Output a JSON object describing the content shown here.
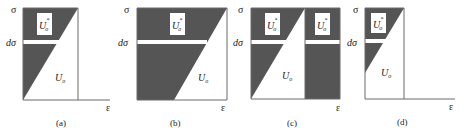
{
  "figure": {
    "panels": [
      {
        "id": "a",
        "caption": "(a)",
        "y_label": "σ",
        "dy_label": "dσ",
        "x_label": "ε",
        "complementary_label": "U",
        "complementary_sup": "*",
        "complementary_sub": "o",
        "strain_label": "U",
        "strain_sub": "o"
      },
      {
        "id": "b",
        "caption": "(b)",
        "y_label": "σ",
        "dy_label": "dσ",
        "x_label": "ε",
        "complementary_label": "U",
        "complementary_sup": "*",
        "complementary_sub": "o",
        "strain_label": "U",
        "strain_sub": "o"
      },
      {
        "id": "c",
        "caption": "(c)",
        "y_label": "σ",
        "dy_label": "dσ",
        "x_label": "ε",
        "complementary_label": "U",
        "complementary_sup": "*",
        "complementary_sub": "o",
        "complementary_label_2": "U",
        "strain_label": "U",
        "strain_sub": "o"
      },
      {
        "id": "d",
        "caption": "(d)",
        "y_label": "σ",
        "dy_label": "dσ",
        "x_label": "ε",
        "complementary_label": "U",
        "complementary_sup": "*",
        "complementary_sub": "o",
        "strain_label": "U",
        "strain_sub": "o"
      }
    ]
  }
}
